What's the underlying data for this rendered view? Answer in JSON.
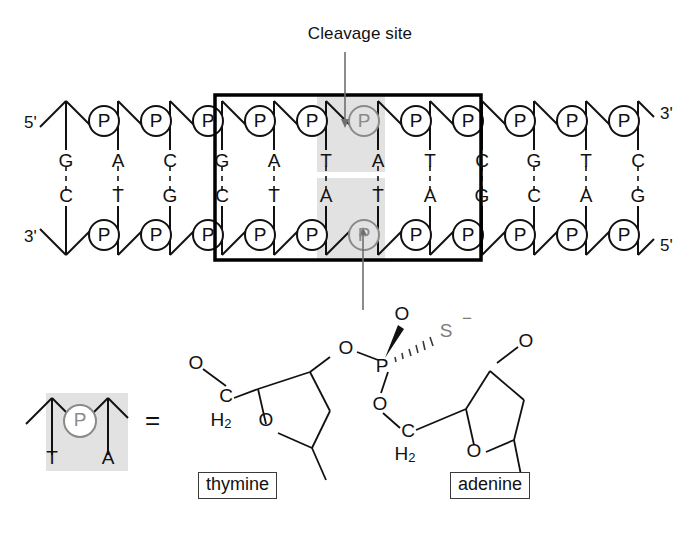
{
  "figure": {
    "title_annotation": "Cleavage site"
  },
  "dna": {
    "left_end_top_label": "5'",
    "left_end_bottom_label": "3'",
    "right_end_top_label": "3'",
    "right_end_bottom_label": "5'",
    "phosphate_symbol": "P",
    "top_strand": [
      "G",
      "A",
      "C",
      "G",
      "A",
      "T",
      "A",
      "T",
      "C",
      "G",
      "T",
      "C"
    ],
    "bottom_strand": [
      "C",
      "T",
      "G",
      "C",
      "T",
      "A",
      "T",
      "A",
      "G",
      "C",
      "A",
      "G"
    ],
    "recognition_box": {
      "start_index": 3,
      "end_index": 8,
      "top_sequence": "GATATC",
      "bottom_sequence": "CTATAG"
    },
    "highlight": {
      "top_bases": [
        "T",
        "A"
      ],
      "bottom_bases": [
        "A",
        "T"
      ],
      "color": "#e2e2e2"
    },
    "cleavage_arrows": {
      "top_arrow_direction": "down",
      "bottom_arrow_direction": "up"
    }
  },
  "legend": {
    "phosphate_symbol": "P",
    "base_top": "T",
    "base_bottom": "A",
    "equals_sign": "="
  },
  "structure": {
    "phosphorus": "P",
    "double_bond_oxygen": "O",
    "sulfur": "S",
    "sulfur_charge": "−",
    "bridging_oxygen_left": "O",
    "bridging_oxygen_right": "O",
    "left_sugar": {
      "terminal_oxygen": "O",
      "carbon": "C",
      "carbon_hydrogens": "H",
      "carbon_hydrogen_count": "2",
      "ring_oxygen": "O",
      "base_label": "thymine"
    },
    "right_sugar": {
      "terminal_oxygen": "O",
      "carbon": "C",
      "carbon_hydrogens": "H",
      "carbon_hydrogen_count": "2",
      "ring_oxygen": "O",
      "base_label": "adenine"
    }
  },
  "colors": {
    "ink": "#111111",
    "gray_highlight": "#e2e2e2",
    "gray_ink": "#7c7c7c",
    "box_stroke": "#000000"
  }
}
